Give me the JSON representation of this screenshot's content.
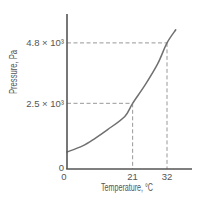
{
  "colors": {
    "axis": "#555555",
    "curve": "#707070",
    "guide": "#8c8c8c",
    "text": "#555555",
    "background": "#ffffff"
  },
  "chart_data": {
    "type": "line",
    "title": "",
    "xlabel": "Temperature, °C",
    "ylabel": "Pressure, Pa",
    "xlim": [
      0,
      40
    ],
    "ylim": [
      0,
      5900
    ],
    "grid": false,
    "legend": null,
    "x": [
      0,
      5,
      9,
      13,
      18.5,
      21,
      25,
      29,
      32,
      34.8
    ],
    "series": [
      {
        "name": "",
        "values": [
          650,
          880,
          1170,
          1500,
          2000,
          2500,
          3200,
          4000,
          4800,
          5300
        ]
      }
    ],
    "x_ticks": [
      {
        "value": 0,
        "label": "0"
      },
      {
        "value": 21,
        "label": "21"
      },
      {
        "value": 32,
        "label": "32"
      }
    ],
    "y_ticks": [
      {
        "value": 0,
        "label": "0"
      },
      {
        "value": 2500,
        "label": "2.5 × 10³"
      },
      {
        "value": 4800,
        "label": "4.8 × 10³"
      }
    ],
    "annotations": [
      {
        "x": 21,
        "y": 2500,
        "style": "dashed guide lines to both axes"
      },
      {
        "x": 32,
        "y": 4800,
        "style": "dashed guide lines to both axes"
      }
    ]
  }
}
